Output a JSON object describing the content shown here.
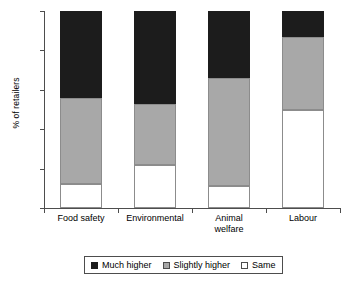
{
  "chart_data": {
    "type": "bar",
    "subtype": "stacked-percent",
    "title": "",
    "xlabel": "",
    "ylabel": "% of retailers",
    "ylim": [
      0,
      100
    ],
    "yticks": [
      0,
      20,
      40,
      60,
      80,
      100
    ],
    "ytick_labels": [
      "0",
      "20",
      "40",
      "60",
      "80",
      "100"
    ],
    "grid": false,
    "legend_position": "bottom",
    "categories": [
      "Food safety",
      "Environmental",
      "Animal\nwelfare",
      "Labour"
    ],
    "series": [
      {
        "name": "Same",
        "color": "#ffffff",
        "values": [
          12,
          22,
          11,
          50
        ]
      },
      {
        "name": "Slightly higher",
        "color": "#a8a8a8",
        "values": [
          44,
          31,
          55,
          37
        ]
      },
      {
        "name": "Much higher",
        "color": "#1c1c1c",
        "values": [
          44,
          47,
          34,
          13
        ]
      }
    ],
    "legend": [
      {
        "label": "Much higher",
        "swatch": "much-higher"
      },
      {
        "label": "Slightly higher",
        "swatch": "slightly-higher"
      },
      {
        "label": "Same",
        "swatch": "same"
      }
    ]
  }
}
